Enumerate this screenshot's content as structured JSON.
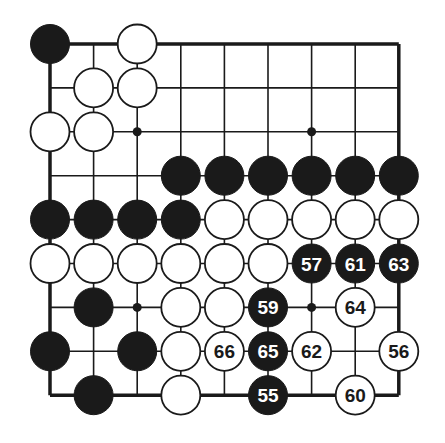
{
  "diagram": {
    "type": "go-board-fragment",
    "grid": {
      "cols": 9,
      "rows": 9,
      "origin_x": 50,
      "origin_y": 44,
      "spacing_x": 43.6,
      "spacing_y": 43.9,
      "edges": [
        "top",
        "left",
        "right",
        "bottom"
      ]
    },
    "colors": {
      "background": "#ffffff",
      "line": "#1a1a1a",
      "black_stone": "#1a1a1a",
      "white_stone": "#ffffff",
      "black_label": "#ffffff",
      "white_label": "#1a1a1a"
    },
    "star_points": [
      {
        "col": 2,
        "row": 2
      },
      {
        "col": 6,
        "row": 2
      },
      {
        "col": 2,
        "row": 6
      },
      {
        "col": 6,
        "row": 6
      }
    ],
    "stones": [
      {
        "col": 0,
        "row": 0,
        "color": "black",
        "label": ""
      },
      {
        "col": 2,
        "row": 0,
        "color": "white",
        "label": ""
      },
      {
        "col": 1,
        "row": 1,
        "color": "white",
        "label": ""
      },
      {
        "col": 2,
        "row": 1,
        "color": "white",
        "label": ""
      },
      {
        "col": 0,
        "row": 2,
        "color": "white",
        "label": ""
      },
      {
        "col": 1,
        "row": 2,
        "color": "white",
        "label": ""
      },
      {
        "col": 3,
        "row": 3,
        "color": "black",
        "label": ""
      },
      {
        "col": 4,
        "row": 3,
        "color": "black",
        "label": ""
      },
      {
        "col": 5,
        "row": 3,
        "color": "black",
        "label": ""
      },
      {
        "col": 6,
        "row": 3,
        "color": "black",
        "label": ""
      },
      {
        "col": 7,
        "row": 3,
        "color": "black",
        "label": ""
      },
      {
        "col": 8,
        "row": 3,
        "color": "black",
        "label": ""
      },
      {
        "col": 0,
        "row": 4,
        "color": "black",
        "label": ""
      },
      {
        "col": 1,
        "row": 4,
        "color": "black",
        "label": ""
      },
      {
        "col": 2,
        "row": 4,
        "color": "black",
        "label": ""
      },
      {
        "col": 3,
        "row": 4,
        "color": "black",
        "label": ""
      },
      {
        "col": 4,
        "row": 4,
        "color": "white",
        "label": ""
      },
      {
        "col": 5,
        "row": 4,
        "color": "white",
        "label": ""
      },
      {
        "col": 6,
        "row": 4,
        "color": "white",
        "label": ""
      },
      {
        "col": 7,
        "row": 4,
        "color": "white",
        "label": ""
      },
      {
        "col": 8,
        "row": 4,
        "color": "white",
        "label": ""
      },
      {
        "col": 0,
        "row": 5,
        "color": "white",
        "label": ""
      },
      {
        "col": 1,
        "row": 5,
        "color": "white",
        "label": ""
      },
      {
        "col": 2,
        "row": 5,
        "color": "white",
        "label": ""
      },
      {
        "col": 3,
        "row": 5,
        "color": "white",
        "label": ""
      },
      {
        "col": 4,
        "row": 5,
        "color": "white",
        "label": ""
      },
      {
        "col": 5,
        "row": 5,
        "color": "white",
        "label": ""
      },
      {
        "col": 6,
        "row": 5,
        "color": "black",
        "label": "57"
      },
      {
        "col": 7,
        "row": 5,
        "color": "black",
        "label": "61"
      },
      {
        "col": 8,
        "row": 5,
        "color": "black",
        "label": "63"
      },
      {
        "col": 1,
        "row": 6,
        "color": "black",
        "label": ""
      },
      {
        "col": 3,
        "row": 6,
        "color": "white",
        "label": ""
      },
      {
        "col": 4,
        "row": 6,
        "color": "white",
        "label": ""
      },
      {
        "col": 5,
        "row": 6,
        "color": "black",
        "label": "59"
      },
      {
        "col": 7,
        "row": 6,
        "color": "white",
        "label": "64"
      },
      {
        "col": 0,
        "row": 7,
        "color": "black",
        "label": ""
      },
      {
        "col": 2,
        "row": 7,
        "color": "black",
        "label": ""
      },
      {
        "col": 3,
        "row": 7,
        "color": "white",
        "label": ""
      },
      {
        "col": 4,
        "row": 7,
        "color": "white",
        "label": "66"
      },
      {
        "col": 5,
        "row": 7,
        "color": "black",
        "label": "65"
      },
      {
        "col": 6,
        "row": 7,
        "color": "white",
        "label": "62"
      },
      {
        "col": 8,
        "row": 7,
        "color": "white",
        "label": "56"
      },
      {
        "col": 1,
        "row": 8,
        "color": "black",
        "label": ""
      },
      {
        "col": 3,
        "row": 8,
        "color": "white",
        "label": ""
      },
      {
        "col": 5,
        "row": 8,
        "color": "black",
        "label": "55"
      },
      {
        "col": 7,
        "row": 8,
        "color": "white",
        "label": "60"
      }
    ],
    "move_numbers_shown": [
      "55",
      "56",
      "57",
      "59",
      "60",
      "61",
      "62",
      "63",
      "64",
      "65",
      "66"
    ]
  }
}
